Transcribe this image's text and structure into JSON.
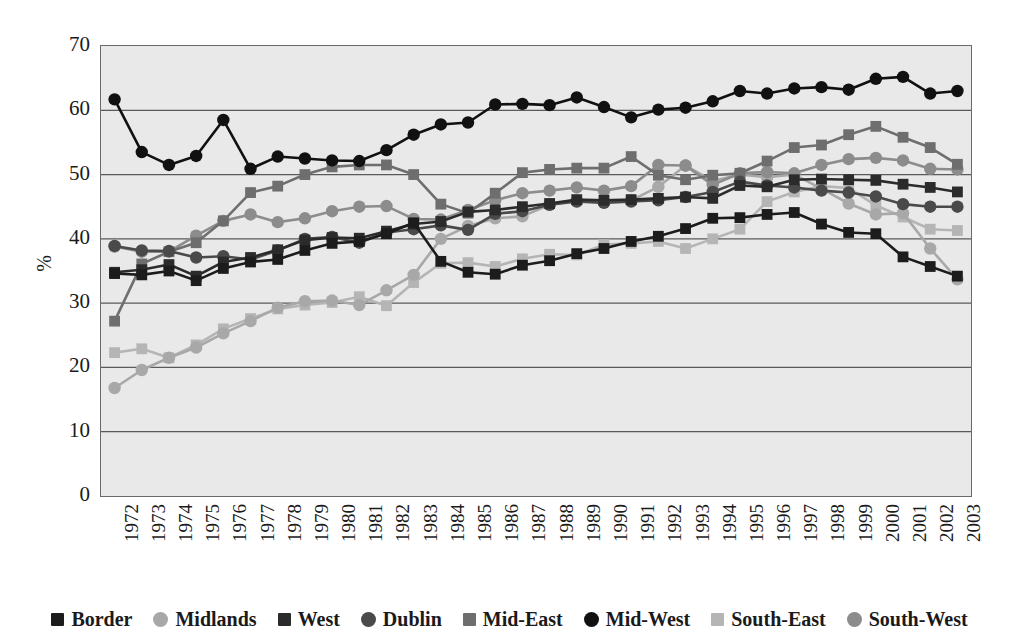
{
  "chart_data": {
    "type": "line",
    "title": "",
    "xlabel": "",
    "ylabel": "%",
    "ylim": [
      0,
      70
    ],
    "yticks": [
      0,
      10,
      20,
      30,
      40,
      50,
      60,
      70
    ],
    "grid": true,
    "legend_position": "bottom",
    "x": [
      1972,
      1973,
      1974,
      1975,
      1976,
      1977,
      1978,
      1979,
      1980,
      1981,
      1982,
      1983,
      1984,
      1985,
      1986,
      1987,
      1988,
      1989,
      1990,
      1991,
      1992,
      1993,
      1994,
      1995,
      1996,
      1997,
      1998,
      1999,
      2000,
      2001,
      2002,
      2003
    ],
    "series": [
      {
        "name": "Border",
        "marker": "square",
        "color": "#1c1c1c",
        "values": [
          34.6,
          34.4,
          35.0,
          33.5,
          35.4,
          36.4,
          36.8,
          38.2,
          39.3,
          39.6,
          40.8,
          42.5,
          36.5,
          34.8,
          34.5,
          35.9,
          36.6,
          37.7,
          38.5,
          39.6,
          40.4,
          41.6,
          43.2,
          43.3,
          43.8,
          44.1,
          42.3,
          41.0,
          40.8,
          37.2,
          35.7,
          34.2
        ]
      },
      {
        "name": "Midlands",
        "marker": "circle",
        "color": "#a8a8a8",
        "values": [
          16.8,
          19.6,
          21.5,
          23.1,
          25.3,
          27.2,
          29.3,
          30.3,
          30.4,
          29.7,
          32.0,
          34.4,
          40.0,
          42.0,
          43.2,
          43.5,
          45.3,
          45.9,
          45.7,
          46.0,
          48.1,
          51.4,
          49.0,
          50.0,
          49.6,
          50.0,
          47.8,
          45.5,
          43.8,
          44.0,
          38.5,
          33.7
        ]
      },
      {
        "name": "West",
        "marker": "square",
        "color": "#2b2b2b",
        "values": [
          34.8,
          35.2,
          36.0,
          34.2,
          36.4,
          37.1,
          38.3,
          39.8,
          40.2,
          40.1,
          41.2,
          42.3,
          42.7,
          44.2,
          44.5,
          45.0,
          45.5,
          46.1,
          46.0,
          46.1,
          46.3,
          46.5,
          46.3,
          48.3,
          48.1,
          49.2,
          49.3,
          49.2,
          49.1,
          48.5,
          48.0,
          47.3
        ]
      },
      {
        "name": "Dublin",
        "marker": "circle",
        "color": "#4a4a4a",
        "values": [
          38.9,
          38.2,
          38.1,
          37.1,
          37.3,
          36.8,
          38.2,
          40.0,
          40.3,
          39.4,
          41.0,
          41.5,
          42.1,
          41.4,
          43.9,
          44.3,
          45.3,
          45.8,
          45.6,
          45.8,
          46.0,
          46.5,
          47.3,
          48.9,
          48.3,
          48.0,
          47.5,
          47.2,
          46.6,
          45.4,
          45.0,
          45.0
        ]
      },
      {
        "name": "Mid-East",
        "marker": "square",
        "color": "#6e6e6e",
        "values": [
          27.2,
          36.1,
          38.0,
          39.4,
          42.8,
          47.2,
          48.2,
          50.0,
          51.2,
          51.5,
          51.5,
          50.0,
          45.4,
          44.0,
          47.1,
          50.3,
          50.8,
          51.0,
          51.0,
          52.8,
          49.9,
          49.2,
          49.9,
          50.2,
          52.1,
          54.2,
          54.6,
          56.2,
          57.5,
          55.8,
          54.2,
          51.6
        ]
      },
      {
        "name": "Mid-West",
        "marker": "circle",
        "color": "#111111",
        "values": [
          61.7,
          53.5,
          51.5,
          52.9,
          58.5,
          50.9,
          52.8,
          52.5,
          52.2,
          52.1,
          53.8,
          56.2,
          57.8,
          58.1,
          60.9,
          61.0,
          60.8,
          62.0,
          60.5,
          58.9,
          60.1,
          60.4,
          61.4,
          63.0,
          62.6,
          63.4,
          63.6,
          63.2,
          64.9,
          65.2,
          62.6,
          63.0
        ]
      },
      {
        "name": "South-East",
        "marker": "square",
        "color": "#b5b5b5",
        "values": [
          22.3,
          22.9,
          21.5,
          23.5,
          26.0,
          27.6,
          29.1,
          29.7,
          30.1,
          31.0,
          29.6,
          33.2,
          36.2,
          36.3,
          35.7,
          36.9,
          37.6,
          37.5,
          39.1,
          39.3,
          39.6,
          38.5,
          40.0,
          41.5,
          45.8,
          47.3,
          48.2,
          47.9,
          45.2,
          43.4,
          41.5,
          41.3
        ]
      },
      {
        "name": "South-West",
        "marker": "circle",
        "color": "#8c8c8c",
        "values": [
          38.8,
          38.0,
          38.0,
          40.5,
          42.8,
          43.8,
          42.6,
          43.2,
          44.3,
          45.0,
          45.1,
          43.1,
          43.0,
          44.5,
          46.0,
          47.1,
          47.5,
          48.0,
          47.5,
          48.2,
          51.5,
          51.4,
          48.4,
          50.2,
          50.4,
          50.2,
          51.5,
          52.4,
          52.6,
          52.2,
          50.9,
          50.8
        ]
      }
    ]
  },
  "axes": {
    "y_title": "%",
    "y_tick_labels": [
      "70",
      "60",
      "50",
      "40",
      "30",
      "20",
      "10",
      "0"
    ],
    "x_tick_labels": [
      "1972",
      "1973",
      "1974",
      "1975",
      "1976",
      "1977",
      "1978",
      "1979",
      "1980",
      "1981",
      "1982",
      "1983",
      "1984",
      "1985",
      "1986",
      "1987",
      "1988",
      "1989",
      "1990",
      "1991",
      "1992",
      "1993",
      "1994",
      "1995",
      "1996",
      "1997",
      "1998",
      "1999",
      "2000",
      "2001",
      "2002",
      "2003"
    ]
  },
  "legend": {
    "items": [
      {
        "label": "Border",
        "marker": "square",
        "color": "#1c1c1c"
      },
      {
        "label": "Midlands",
        "marker": "circle",
        "color": "#a8a8a8"
      },
      {
        "label": "West",
        "marker": "square",
        "color": "#2b2b2b"
      },
      {
        "label": "Dublin",
        "marker": "circle",
        "color": "#4a4a4a"
      },
      {
        "label": "Mid-East",
        "marker": "square",
        "color": "#6e6e6e"
      },
      {
        "label": "Mid-West",
        "marker": "circle",
        "color": "#111111"
      },
      {
        "label": "South-East",
        "marker": "square",
        "color": "#b5b5b5"
      },
      {
        "label": "South-West",
        "marker": "circle",
        "color": "#8c8c8c"
      }
    ]
  },
  "style": {
    "plot_background": "#e9e9e9",
    "gridline_color": "#5a5a5a",
    "border_color": "#6a6a6a",
    "page_background": "#ffffff"
  }
}
